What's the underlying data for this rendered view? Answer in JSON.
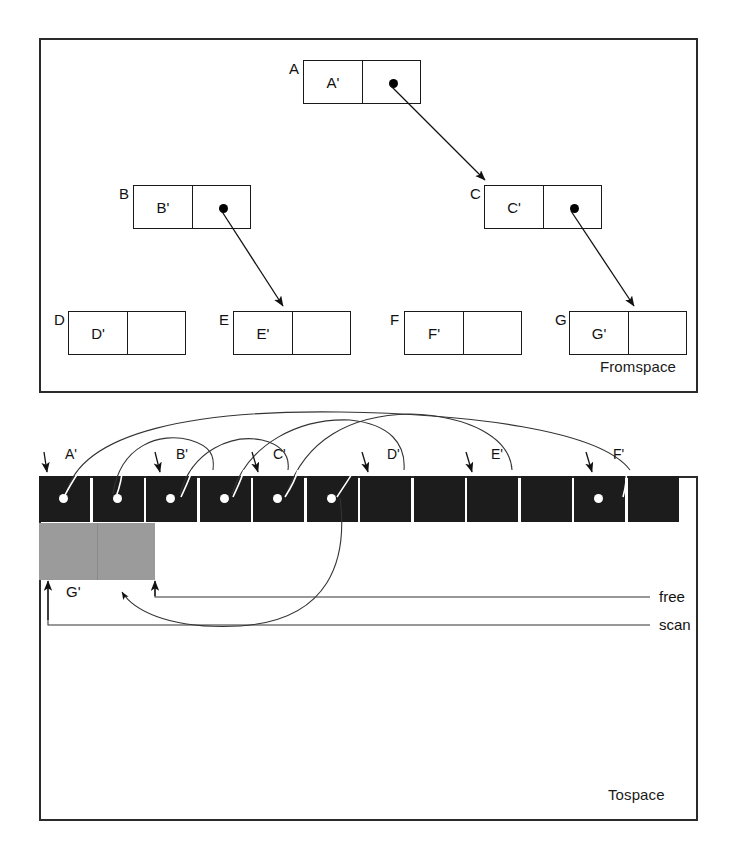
{
  "figure": {
    "panels": [
      {
        "id": "fromspace",
        "caption": "Fromspace"
      },
      {
        "id": "tospace",
        "caption": "Tospace"
      }
    ]
  },
  "fromspace": {
    "caption": "Fromspace",
    "cells": [
      {
        "name": "A",
        "label": "A",
        "car": "A'",
        "has_pointer": true,
        "x": 303,
        "y": 60
      },
      {
        "name": "B",
        "label": "B",
        "car": "B'",
        "has_pointer": true,
        "x": 133,
        "y": 185
      },
      {
        "name": "C",
        "label": "C",
        "car": "C'",
        "has_pointer": true,
        "x": 484,
        "y": 185
      },
      {
        "name": "D",
        "label": "D",
        "car": "D'",
        "has_pointer": false,
        "x": 68,
        "y": 311
      },
      {
        "name": "E",
        "label": "E",
        "car": "E'",
        "has_pointer": false,
        "x": 233,
        "y": 311
      },
      {
        "name": "F",
        "label": "F",
        "car": "F'",
        "has_pointer": false,
        "x": 404,
        "y": 311
      },
      {
        "name": "G",
        "label": "G",
        "car": "G'",
        "has_pointer": false,
        "x": 569,
        "y": 311
      }
    ],
    "pointers": [
      {
        "from": "A",
        "to": "C"
      },
      {
        "from": "B",
        "to": "E"
      },
      {
        "from": "C",
        "to": "G"
      }
    ]
  },
  "tospace": {
    "caption": "Tospace",
    "cell_count": 12,
    "cells": [
      {
        "index": 0,
        "has_pointer": true
      },
      {
        "index": 1,
        "has_pointer": true
      },
      {
        "index": 2,
        "has_pointer": true
      },
      {
        "index": 3,
        "has_pointer": true
      },
      {
        "index": 4,
        "has_pointer": true
      },
      {
        "index": 5,
        "has_pointer": true
      },
      {
        "index": 6,
        "has_pointer": false
      },
      {
        "index": 7,
        "has_pointer": false
      },
      {
        "index": 8,
        "has_pointer": false
      },
      {
        "index": 9,
        "has_pointer": false
      },
      {
        "index": 10,
        "has_pointer": true
      },
      {
        "index": 11,
        "has_pointer": false
      }
    ],
    "copied_labels": [
      {
        "text": "A'",
        "x": 65,
        "y": 447
      },
      {
        "text": "B'",
        "x": 176,
        "y": 447
      },
      {
        "text": "C'",
        "x": 273,
        "y": 447
      },
      {
        "text": "D'",
        "x": 387,
        "y": 447
      },
      {
        "text": "E'",
        "x": 491,
        "y": 447
      },
      {
        "text": "F'",
        "x": 613,
        "y": 447
      }
    ],
    "free_block_label": "G'",
    "pointer_labels": [
      {
        "name": "free",
        "text": "free",
        "x": 659,
        "y": 592
      },
      {
        "name": "scan",
        "text": "scan",
        "x": 659,
        "y": 620
      }
    ]
  },
  "colors": {
    "allocated_cell": "#1c1c1c",
    "free_cell": "#9b9b9b",
    "outline": "#2b2b2b",
    "pointer_dot": "#000000",
    "tospace_dot": "#ffffff",
    "background": "#ffffff"
  }
}
